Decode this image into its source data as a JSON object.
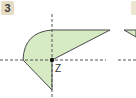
{
  "exercise": {
    "number": "3"
  },
  "figure": {
    "center_label": "Z",
    "fill_color": "#d6ebc4",
    "stroke_color": "#4a4a4a",
    "axis_color": "#555555",
    "badge_color": "#e6dcc3"
  }
}
